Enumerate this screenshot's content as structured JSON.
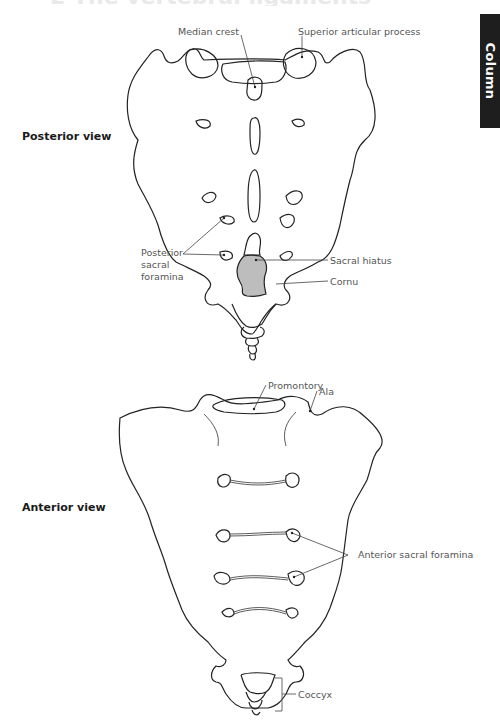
{
  "page": {
    "title_fragment": "2 The vertebral ligaments",
    "side_tab": {
      "label": "Column",
      "background": "#1e1e1e",
      "text_color": "#ffffff"
    }
  },
  "posterior_view": {
    "label": "Posterior view",
    "callouts": {
      "median_crest": "Median crest",
      "superior_articular_process": "Superior articular process",
      "posterior_sacral_foramina": [
        "Posterior",
        "sacral",
        "foramina"
      ],
      "sacral_hiatus": "Sacral hiatus",
      "cornu": "Cornu"
    },
    "hiatus_fill": "#bdbdbd"
  },
  "anterior_view": {
    "label": "Anterior view",
    "callouts": {
      "promontory": "Promontory",
      "ala": "Ala",
      "anterior_sacral_foramina": "Anterior sacral foramina",
      "coccyx": "Coccyx"
    }
  }
}
